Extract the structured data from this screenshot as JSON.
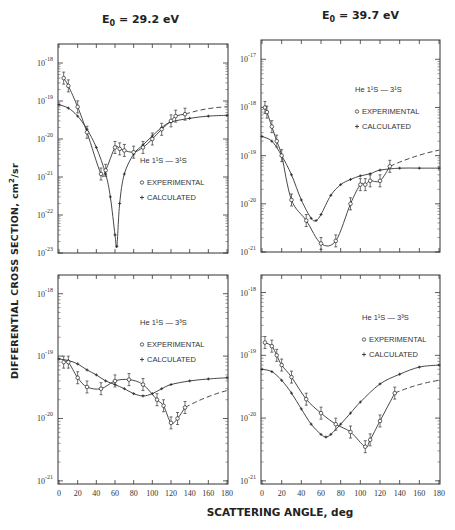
{
  "figure": {
    "y_axis_label": "DIFFERENTIAL CROSS SECTION, cm",
    "y_axis_unit_exp": "2",
    "y_axis_unit_suffix": "/sr",
    "x_axis_label": "SCATTERING ANGLE, deg",
    "columns": [
      {
        "title_prefix": "E",
        "title_sub": "0",
        "title_value": " = 29.2 eV"
      },
      {
        "title_prefix": "E",
        "title_sub": "0",
        "title_value": " = 39.7 eV"
      }
    ]
  },
  "legend": {
    "experimental": "EXPERIMENTAL",
    "calculated": "CALCULATED"
  },
  "chart_data": [
    {
      "type": "line",
      "panel": "top-left",
      "title": "E0 = 29.2 eV",
      "transition": "He 1¹S → 3¹S",
      "xlabel": "SCATTERING ANGLE, deg",
      "ylabel": "DIFFERENTIAL CROSS SECTION, cm²/sr",
      "yscale": "log",
      "xlim": [
        0,
        180
      ],
      "ylim": [
        1e-23,
        3e-18
      ],
      "yticks": [
        "10^-18",
        "10^-19",
        "10^-20",
        "10^-21",
        "10^-22",
        "10^-23"
      ],
      "series": [
        {
          "name": "EXPERIMENTAL",
          "marker": "circle",
          "x": [
            5,
            10,
            20,
            30,
            45,
            50,
            60,
            65,
            70,
            80,
            90,
            100,
            110,
            120,
            125,
            135
          ],
          "y": [
            4e-19,
            2.5e-19,
            7e-20,
            1.5e-20,
            1.2e-21,
            1.5e-21,
            6e-21,
            5.5e-21,
            5e-21,
            4.5e-21,
            6e-21,
            1e-20,
            1.8e-20,
            3e-20,
            4e-20,
            4.5e-20
          ]
        },
        {
          "name": "CALCULATED",
          "marker": "plus",
          "x": [
            0,
            10,
            20,
            30,
            40,
            50,
            55,
            60,
            62,
            65,
            70,
            80,
            90,
            100,
            110,
            120,
            140,
            160,
            180
          ],
          "y": [
            8e-20,
            6.5e-20,
            4e-20,
            1.8e-20,
            6e-21,
            1.2e-21,
            3e-22,
            3e-23,
            1.5e-23,
            2e-22,
            1.2e-21,
            4e-21,
            7e-21,
            1.2e-20,
            2e-20,
            2.8e-20,
            3.5e-20,
            4e-20,
            4.2e-20
          ]
        }
      ]
    },
    {
      "type": "line",
      "panel": "top-right",
      "title": "E0 = 39.7 eV",
      "transition": "He 1¹S → 3¹S",
      "xlabel": "SCATTERING ANGLE, deg",
      "ylabel": "DIFFERENTIAL CROSS SECTION, cm²/sr",
      "yscale": "log",
      "xlim": [
        0,
        180
      ],
      "ylim": [
        1e-21,
        2.5e-17
      ],
      "yticks": [
        "10^-17",
        "10^-18",
        "10^-19",
        "10^-20",
        "10^-21"
      ],
      "series": [
        {
          "name": "EXPERIMENTAL",
          "marker": "circle",
          "x": [
            3,
            5,
            10,
            15,
            20,
            30,
            45,
            60,
            75,
            90,
            100,
            105,
            110,
            120,
            130
          ],
          "y": [
            1e-18,
            8e-19,
            4e-19,
            2e-19,
            1e-19,
            1.2e-20,
            4.5e-21,
            1.5e-21,
            1.7e-21,
            1e-20,
            2.5e-20,
            2.5e-20,
            3e-20,
            3e-20,
            6e-20
          ]
        },
        {
          "name": "CALCULATED",
          "marker": "plus",
          "x": [
            0,
            10,
            20,
            30,
            40,
            50,
            55,
            60,
            70,
            80,
            90,
            100,
            110,
            120,
            140,
            160,
            180
          ],
          "y": [
            2.5e-19,
            2e-19,
            1e-19,
            4e-20,
            1.2e-20,
            5e-21,
            4.5e-21,
            6e-21,
            1.5e-20,
            2.5e-20,
            3.2e-20,
            3.8e-20,
            4.2e-20,
            5e-20,
            5.5e-20,
            5.5e-20,
            5.5e-20
          ]
        }
      ]
    },
    {
      "type": "line",
      "panel": "bottom-left",
      "title": "E0 = 29.2 eV",
      "transition": "He 1¹S → 3³S",
      "xlabel": "SCATTERING ANGLE, deg",
      "ylabel": "DIFFERENTIAL CROSS SECTION, cm²/sr",
      "yscale": "log",
      "xlim": [
        0,
        180
      ],
      "ylim": [
        1e-21,
        3e-18
      ],
      "xticks": [
        0,
        20,
        40,
        60,
        80,
        100,
        120,
        140,
        160,
        180
      ],
      "yticks": [
        "10^-18",
        "10^-19",
        "10^-20",
        "10^-21"
      ],
      "series": [
        {
          "name": "EXPERIMENTAL",
          "marker": "circle",
          "x": [
            5,
            10,
            20,
            30,
            45,
            60,
            75,
            90,
            105,
            112,
            120,
            127,
            135
          ],
          "y": [
            8e-20,
            8e-20,
            4.5e-20,
            3.2e-20,
            3e-20,
            4e-20,
            4.2e-20,
            3.5e-20,
            2e-20,
            1.6e-20,
            8.5e-21,
            1e-20,
            1.5e-20
          ]
        },
        {
          "name": "CALCULATED",
          "marker": "plus",
          "x": [
            0,
            10,
            20,
            30,
            40,
            50,
            60,
            70,
            80,
            90,
            100,
            110,
            120,
            140,
            160,
            180
          ],
          "y": [
            9e-20,
            8.5e-20,
            7.5e-20,
            6e-20,
            5e-20,
            4e-20,
            3.5e-20,
            3e-20,
            2.5e-20,
            2.3e-20,
            2.5e-20,
            3e-20,
            3.5e-20,
            4e-20,
            4.3e-20,
            4.5e-20
          ]
        }
      ]
    },
    {
      "type": "line",
      "panel": "bottom-right",
      "title": "E0 = 39.7 eV",
      "transition": "He 1¹S → 3³S",
      "xlabel": "SCATTERING ANGLE, deg",
      "ylabel": "DIFFERENTIAL CROSS SECTION, cm²/sr",
      "yscale": "log",
      "xlim": [
        0,
        180
      ],
      "ylim": [
        1e-21,
        3e-18
      ],
      "xticks": [
        0,
        20,
        40,
        60,
        80,
        100,
        120,
        140,
        160,
        180
      ],
      "yticks": [
        "10^-18",
        "10^-19",
        "10^-20",
        "10^-21"
      ],
      "series": [
        {
          "name": "EXPERIMENTAL",
          "marker": "circle",
          "x": [
            3,
            10,
            15,
            20,
            30,
            45,
            60,
            75,
            90,
            105,
            110,
            120,
            135
          ],
          "y": [
            1.6e-19,
            1.4e-19,
            1e-19,
            7e-20,
            4.5e-20,
            2e-20,
            1.2e-20,
            8e-21,
            6e-21,
            3.5e-21,
            4.5e-21,
            9e-21,
            2.5e-20
          ]
        },
        {
          "name": "CALCULATED",
          "marker": "plus",
          "x": [
            0,
            10,
            20,
            30,
            40,
            50,
            60,
            65,
            70,
            80,
            90,
            100,
            120,
            140,
            160,
            180
          ],
          "y": [
            6e-20,
            5.5e-20,
            4e-20,
            2.5e-20,
            1.4e-20,
            8e-21,
            5.5e-21,
            5e-21,
            5.5e-21,
            8e-21,
            1.2e-20,
            1.8e-20,
            3.5e-20,
            5e-20,
            6.5e-20,
            7e-20
          ]
        }
      ]
    }
  ]
}
